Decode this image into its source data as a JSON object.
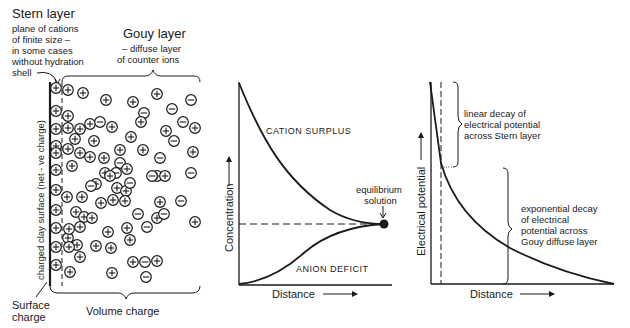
{
  "panel_a": {
    "stern_title": "Stern layer",
    "stern_desc": [
      "plane of cations",
      "of finite size –",
      "in some cases",
      "without hydration",
      "shell"
    ],
    "gouy_title": "Gouy layer",
    "gouy_desc": [
      "– diffuse layer",
      "of counter ions"
    ],
    "surface_vertical_label": "charged clay surface (net - ve charge)",
    "surface_charge_label": [
      "Surface",
      "charge"
    ],
    "volume_charge_label": "Volume charge",
    "stern_ions_y": [
      88,
      111,
      129,
      146,
      153,
      170,
      190,
      210,
      228,
      247,
      265
    ],
    "ions": [
      {
        "x": 68,
        "y": 90,
        "s": "+"
      },
      {
        "x": 83,
        "y": 93,
        "s": "+"
      },
      {
        "x": 106,
        "y": 100,
        "s": "+"
      },
      {
        "x": 133,
        "y": 102,
        "s": "+"
      },
      {
        "x": 144,
        "y": 113,
        "s": "-"
      },
      {
        "x": 157,
        "y": 94,
        "s": "+"
      },
      {
        "x": 172,
        "y": 109,
        "s": "-"
      },
      {
        "x": 191,
        "y": 100,
        "s": "-"
      },
      {
        "x": 68,
        "y": 116,
        "s": "+"
      },
      {
        "x": 68,
        "y": 128,
        "s": "+"
      },
      {
        "x": 80,
        "y": 129,
        "s": "+"
      },
      {
        "x": 90,
        "y": 124,
        "s": "+"
      },
      {
        "x": 100,
        "y": 122,
        "s": "-"
      },
      {
        "x": 112,
        "y": 127,
        "s": "+"
      },
      {
        "x": 141,
        "y": 122,
        "s": "+"
      },
      {
        "x": 166,
        "y": 131,
        "s": "+"
      },
      {
        "x": 174,
        "y": 141,
        "s": "-"
      },
      {
        "x": 183,
        "y": 122,
        "s": "-"
      },
      {
        "x": 195,
        "y": 128,
        "s": "+"
      },
      {
        "x": 75,
        "y": 139,
        "s": "+"
      },
      {
        "x": 94,
        "y": 141,
        "s": "+"
      },
      {
        "x": 120,
        "y": 150,
        "s": "+"
      },
      {
        "x": 131,
        "y": 137,
        "s": "+"
      },
      {
        "x": 193,
        "y": 152,
        "s": "+"
      },
      {
        "x": 68,
        "y": 149,
        "s": "+"
      },
      {
        "x": 80,
        "y": 153,
        "s": "+"
      },
      {
        "x": 90,
        "y": 157,
        "s": "+"
      },
      {
        "x": 104,
        "y": 158,
        "s": "+"
      },
      {
        "x": 120,
        "y": 163,
        "s": "-"
      },
      {
        "x": 143,
        "y": 150,
        "s": "+"
      },
      {
        "x": 160,
        "y": 158,
        "s": "-"
      },
      {
        "x": 72,
        "y": 166,
        "s": "+"
      },
      {
        "x": 105,
        "y": 173,
        "s": "+"
      },
      {
        "x": 116,
        "y": 173,
        "s": "-"
      },
      {
        "x": 127,
        "y": 169,
        "s": "+"
      },
      {
        "x": 157,
        "y": 176,
        "s": "+"
      },
      {
        "x": 152,
        "y": 176,
        "s": "-"
      },
      {
        "x": 165,
        "y": 176,
        "s": "+"
      },
      {
        "x": 191,
        "y": 173,
        "s": "-"
      },
      {
        "x": 96,
        "y": 184,
        "s": "+"
      },
      {
        "x": 110,
        "y": 176,
        "s": "+"
      },
      {
        "x": 91,
        "y": 186,
        "s": "-"
      },
      {
        "x": 117,
        "y": 188,
        "s": "+"
      },
      {
        "x": 126,
        "y": 191,
        "s": "+"
      },
      {
        "x": 130,
        "y": 183,
        "s": "-"
      },
      {
        "x": 160,
        "y": 202,
        "s": "+"
      },
      {
        "x": 181,
        "y": 201,
        "s": "-"
      },
      {
        "x": 82,
        "y": 197,
        "s": "+"
      },
      {
        "x": 67,
        "y": 197,
        "s": "+"
      },
      {
        "x": 101,
        "y": 203,
        "s": "+"
      },
      {
        "x": 113,
        "y": 200,
        "s": "+"
      },
      {
        "x": 157,
        "y": 218,
        "s": "+"
      },
      {
        "x": 164,
        "y": 214,
        "s": "-"
      },
      {
        "x": 147,
        "y": 227,
        "s": "-"
      },
      {
        "x": 138,
        "y": 214,
        "s": "-"
      },
      {
        "x": 195,
        "y": 222,
        "s": "+"
      },
      {
        "x": 76,
        "y": 212,
        "s": "+"
      },
      {
        "x": 84,
        "y": 217,
        "s": "+"
      },
      {
        "x": 92,
        "y": 218,
        "s": "+"
      },
      {
        "x": 80,
        "y": 227,
        "s": "+"
      },
      {
        "x": 127,
        "y": 228,
        "s": "+"
      },
      {
        "x": 108,
        "y": 232,
        "s": "+"
      },
      {
        "x": 125,
        "y": 201,
        "s": "+"
      },
      {
        "x": 68,
        "y": 238,
        "s": "+"
      },
      {
        "x": 77,
        "y": 245,
        "s": "+"
      },
      {
        "x": 69,
        "y": 247,
        "s": "+"
      },
      {
        "x": 69,
        "y": 229,
        "s": "+"
      },
      {
        "x": 80,
        "y": 257,
        "s": "+"
      },
      {
        "x": 96,
        "y": 246,
        "s": "+"
      },
      {
        "x": 111,
        "y": 248,
        "s": "+"
      },
      {
        "x": 133,
        "y": 262,
        "s": "+"
      },
      {
        "x": 145,
        "y": 262,
        "s": "-"
      },
      {
        "x": 157,
        "y": 261,
        "s": "+"
      },
      {
        "x": 70,
        "y": 272,
        "s": "+"
      },
      {
        "x": 112,
        "y": 273,
        "s": "+"
      },
      {
        "x": 146,
        "y": 277,
        "s": "-"
      },
      {
        "x": 130,
        "y": 240,
        "s": "+"
      }
    ]
  },
  "panel_b": {
    "curve_upper_label": "CATION SURPLUS",
    "curve_lower_label": "ANION DEFICIT",
    "equilibrium_label": [
      "equilibrium",
      "solution"
    ],
    "ylabel": "Concentration",
    "xlabel": "Distance"
  },
  "panel_c": {
    "stern_note": [
      "linear decay of",
      "electrical potential",
      "across Stern layer"
    ],
    "gouy_note": [
      "exponential decay",
      "of electrical",
      "potential across",
      "Gouy diffuse layer"
    ],
    "ylabel": "Electrical potential",
    "xlabel": "Distance"
  },
  "chart_data": [
    {
      "type": "line",
      "title": "",
      "xlabel": "Distance",
      "ylabel": "Concentration",
      "series": [
        {
          "name": "CATION SURPLUS",
          "x": [
            0,
            0.2,
            0.4,
            0.6,
            0.8,
            1.0
          ],
          "y": [
            1.0,
            0.68,
            0.45,
            0.33,
            0.27,
            0.24
          ]
        },
        {
          "name": "ANION DEFICIT",
          "x": [
            0,
            0.2,
            0.4,
            0.6,
            0.8,
            1.0
          ],
          "y": [
            0.0,
            0.03,
            0.09,
            0.16,
            0.21,
            0.24
          ]
        },
        {
          "name": "equilibrium solution",
          "x": [
            0,
            1.0
          ],
          "y": [
            0.24,
            0.24
          ]
        }
      ],
      "annotations": [
        "equilibrium solution"
      ],
      "grid": false
    },
    {
      "type": "line",
      "title": "",
      "xlabel": "Distance",
      "ylabel": "Electrical potential",
      "series": [
        {
          "name": "potential",
          "x": [
            0,
            0.05,
            0.1,
            0.3,
            0.5,
            0.75,
            1.0
          ],
          "y": [
            1.0,
            0.6,
            0.42,
            0.28,
            0.17,
            0.07,
            0.0
          ]
        }
      ],
      "annotations": [
        "linear decay of electrical potential across Stern layer",
        "exponential decay of electrical potential across Gouy diffuse layer"
      ],
      "grid": false
    }
  ]
}
